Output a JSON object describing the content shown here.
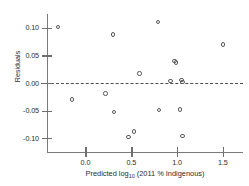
{
  "chart_data": {
    "type": "scatter",
    "title": "",
    "xlabel": "Predicted log10 (2011 % Indigenous)",
    "xlabel_prefix": "Predicted log",
    "xlabel_sub": "10",
    "xlabel_suffix": " (2011 % Indigenous)",
    "ylabel": "Residuals",
    "xlim": [
      -0.42,
      1.72
    ],
    "ylim": [
      -0.125,
      0.125
    ],
    "xticks": [
      0.0,
      0.5,
      1.0,
      1.5
    ],
    "xticklabels": [
      "0.0",
      "0.5",
      "1.0",
      "1.5"
    ],
    "yticks": [
      0.1,
      0.05,
      0.0,
      -0.05,
      -0.1
    ],
    "yticklabels": [
      "0.10",
      "0.05",
      "0.00",
      "-0.05",
      "-0.10"
    ],
    "grid": false,
    "legend": null,
    "reference_lines": [
      {
        "name": "zero-residual-line",
        "axis": "y",
        "value": 0.0,
        "style": "dashed"
      }
    ],
    "marker": "open-circle",
    "points": [
      {
        "x": -0.3,
        "y": 0.102
      },
      {
        "x": -0.15,
        "y": -0.03
      },
      {
        "x": 0.22,
        "y": -0.019
      },
      {
        "x": 0.3,
        "y": 0.088
      },
      {
        "x": 0.31,
        "y": -0.052
      },
      {
        "x": 0.47,
        "y": -0.098
      },
      {
        "x": 0.53,
        "y": -0.088
      },
      {
        "x": 0.59,
        "y": 0.017
      },
      {
        "x": 0.79,
        "y": 0.111
      },
      {
        "x": 0.8,
        "y": -0.049
      },
      {
        "x": 0.93,
        "y": 0.004
      },
      {
        "x": 0.97,
        "y": 0.04
      },
      {
        "x": 0.99,
        "y": 0.037
      },
      {
        "x": 1.03,
        "y": -0.048
      },
      {
        "x": 1.05,
        "y": 0.005
      },
      {
        "x": 1.06,
        "y": 0.002
      },
      {
        "x": 1.06,
        "y": -0.096
      },
      {
        "x": 1.5,
        "y": 0.07
      }
    ]
  }
}
